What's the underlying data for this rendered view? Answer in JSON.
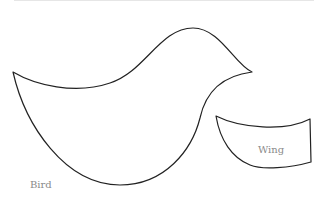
{
  "diagram": {
    "shapes": [
      {
        "name": "bird",
        "label": "Bird"
      },
      {
        "name": "wing",
        "label": "Wing"
      }
    ],
    "colors": {
      "outline": "#222222",
      "label": "#8a8a8a",
      "background": "#ffffff"
    }
  }
}
